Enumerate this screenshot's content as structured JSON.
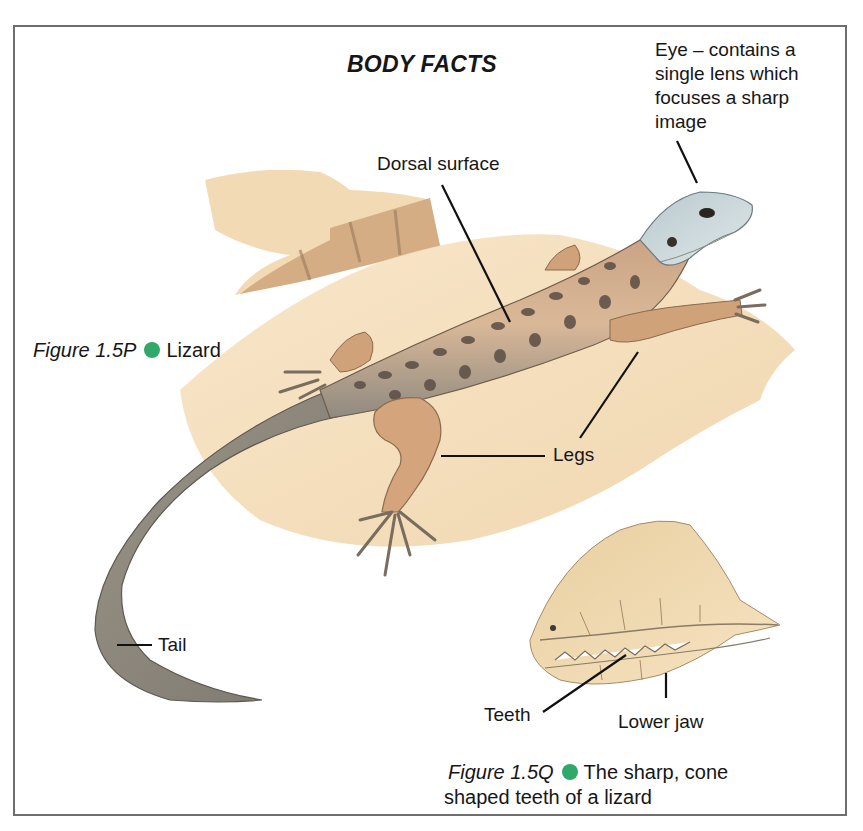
{
  "title": "BODY FACTS",
  "accent_color": "#2fa86a",
  "labels": {
    "eye": "Eye – contains a single lens which focuses a sharp image",
    "dorsal": "Dorsal surface",
    "legs": "Legs",
    "tail": "Tail",
    "teeth": "Teeth",
    "lower_jaw": "Lower jaw"
  },
  "figures": [
    {
      "number": "Figure 1.5P",
      "bullet_icon": "green-dot-icon",
      "caption": "Lizard"
    },
    {
      "number": "Figure 1.5Q",
      "bullet_icon": "green-dot-icon",
      "caption": "The sharp, cone",
      "caption_line2": "shaped teeth of a lizard"
    }
  ],
  "illustrations": [
    {
      "name": "lizard-illustration",
      "subject": "Lizard on rock"
    },
    {
      "name": "jaw-closeup-illustration",
      "subject": "Lizard jaw and teeth close-up"
    }
  ]
}
